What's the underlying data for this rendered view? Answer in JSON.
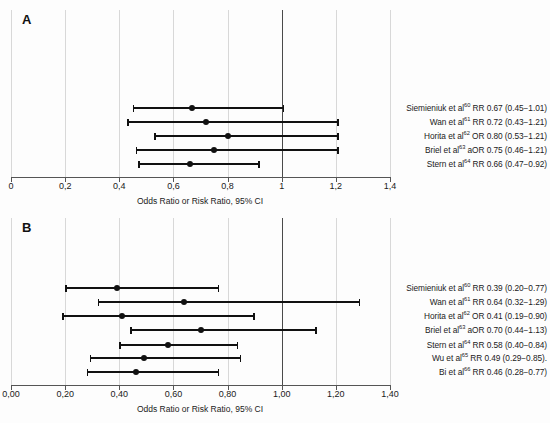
{
  "figure": {
    "background_color": "#fdfdfd",
    "marker_color": "#111111",
    "gridline_color": "#d8d8d8",
    "reference_line_color": "#4a4a4a"
  },
  "panels": [
    {
      "id": "A",
      "letter": "A",
      "axis_title": "Odds Ratio or Risk Ratio, 95% CI",
      "tick_labels": [
        "0",
        "0,2",
        "0,4",
        "0,6",
        "0,8",
        "1",
        "1,2",
        "1,4"
      ],
      "tick_values": [
        0,
        0.2,
        0.4,
        0.6,
        0.8,
        1.0,
        1.2,
        1.4
      ],
      "reference_value": 1.0,
      "rows": [
        {
          "label_text": "Siemieniuk et al",
          "ref": "60",
          "measure": "RR",
          "estimate_text": "0.67",
          "ci_text": "(0.45−1.01)",
          "full_label": "Siemieniuk et al60 RR 0.67 (0.45−1.01)",
          "estimate": 0.67,
          "ci_low": 0.45,
          "ci_high": 1.01,
          "trailing": ""
        },
        {
          "label_text": "Wan et al",
          "ref": "61",
          "measure": "RR",
          "estimate_text": "0.72",
          "ci_text": "(0.43−1.21)",
          "full_label": "Wan et al 61 RR 0.72 (0.43−1.21)",
          "estimate": 0.72,
          "ci_low": 0.43,
          "ci_high": 1.21,
          "trailing": ""
        },
        {
          "label_text": "Horita et al",
          "ref": "62",
          "measure": "OR",
          "estimate_text": "0.80",
          "ci_text": "(0.53−1.21)",
          "full_label": "Horita et al 62 OR 0.80 (0.53−1.21)",
          "estimate": 0.8,
          "ci_low": 0.53,
          "ci_high": 1.21,
          "trailing": ""
        },
        {
          "label_text": "Briel et al",
          "ref": "63",
          "measure": "aOR",
          "estimate_text": "0.75",
          "ci_text": "(0.46−1.21)",
          "full_label": "Briel et al 63 aOR 0.75 (0.46−1.21)",
          "estimate": 0.75,
          "ci_low": 0.46,
          "ci_high": 1.21,
          "trailing": ""
        },
        {
          "label_text": "Stern et al",
          "ref": "64",
          "measure": "RR",
          "estimate_text": "0.66",
          "ci_text": "(0.47−0.92)",
          "full_label": "Stern et al 64 RR 0.66 (0.47−0.92)",
          "estimate": 0.66,
          "ci_low": 0.47,
          "ci_high": 0.92,
          "trailing": ""
        }
      ]
    },
    {
      "id": "B",
      "letter": "B",
      "axis_title": "Odds Ratio or Risk Ratio, 95% CI",
      "tick_labels": [
        "0,00",
        "0,20",
        "0,40",
        "0,60",
        "0,80",
        "1,00",
        "1,20",
        "1,40"
      ],
      "tick_values": [
        0,
        0.2,
        0.4,
        0.6,
        0.8,
        1.0,
        1.2,
        1.4
      ],
      "reference_value": 1.0,
      "rows": [
        {
          "label_text": "Siemieniuk et al",
          "ref": "60",
          "measure": "RR",
          "estimate_text": "0.39",
          "ci_text": "(0.20−0.77)",
          "full_label": "Siemieniuk et al 60 RR 0.39 (0.20−0.77)",
          "estimate": 0.39,
          "ci_low": 0.2,
          "ci_high": 0.77,
          "trailing": ""
        },
        {
          "label_text": "Wan et al",
          "ref": "61",
          "measure": "RR",
          "estimate_text": "0.64",
          "ci_text": "(0.32−1.29)",
          "full_label": "Wan et al 61 RR 0.64 (0.32−1.29)",
          "estimate": 0.64,
          "ci_low": 0.32,
          "ci_high": 1.29,
          "trailing": ""
        },
        {
          "label_text": "Horita et al",
          "ref": "62",
          "measure": "OR",
          "estimate_text": "0.41",
          "ci_text": "(0.19−0.90)",
          "full_label": "Horita et al 62 OR 0.41 (0.19−0.90)",
          "estimate": 0.41,
          "ci_low": 0.19,
          "ci_high": 0.9,
          "trailing": ""
        },
        {
          "label_text": "Briel et al",
          "ref": "63",
          "measure": "aOR",
          "estimate_text": "0.70",
          "ci_text": "(0.44−1.13)",
          "full_label": "Briel et al 63 aOR 0.70 (0.44−1.13)",
          "estimate": 0.7,
          "ci_low": 0.44,
          "ci_high": 1.13,
          "trailing": ""
        },
        {
          "label_text": "Stern et al",
          "ref": "64",
          "measure": "RR",
          "estimate_text": "0.58",
          "ci_text": "(0.40−0.84)",
          "full_label": "Stern et al 64 RR 0.58 (0.40−0.84)",
          "estimate": 0.58,
          "ci_low": 0.4,
          "ci_high": 0.84,
          "trailing": ""
        },
        {
          "label_text": "Wu et al",
          "ref": "65",
          "measure": "RR",
          "estimate_text": "0.49",
          "ci_text": "(0.29−0.85)",
          "full_label": "Wu et al 65 RR 0.49 (0.29−0.85).",
          "estimate": 0.49,
          "ci_low": 0.29,
          "ci_high": 0.85,
          "trailing": "."
        },
        {
          "label_text": "Bi et al",
          "ref": "66",
          "measure": "RR",
          "estimate_text": "0.46",
          "ci_text": "(0.28−0.77)",
          "full_label": "Bi et al 66 RR 0.46 (0.28−0.77)",
          "estimate": 0.46,
          "ci_low": 0.28,
          "ci_high": 0.77,
          "trailing": ""
        }
      ]
    }
  ],
  "chart_data": {
    "type": "scatter",
    "subtype": "forest-plot",
    "title": "",
    "xlabel": "Odds Ratio or Risk Ratio, 95% CI",
    "ylabel": "",
    "xlim": [
      0,
      1.4
    ],
    "grid": true,
    "legend": "none",
    "reference_line": 1.0,
    "decimal_separator": ",",
    "panels": [
      {
        "panel": "A",
        "xticks": [
          0,
          0.2,
          0.4,
          0.6,
          0.8,
          1.0,
          1.2,
          1.4
        ],
        "xticklabels": [
          "0",
          "0,2",
          "0,4",
          "0,6",
          "0,8",
          "1",
          "1,2",
          "1,4"
        ],
        "studies": [
          "Siemieniuk et al 60",
          "Wan et al 61",
          "Horita et al 62",
          "Briel et al 63",
          "Stern et al 64"
        ],
        "measures": [
          "RR",
          "RR",
          "OR",
          "aOR",
          "RR"
        ],
        "estimates": [
          0.67,
          0.72,
          0.8,
          0.75,
          0.66
        ],
        "ci_low": [
          0.45,
          0.43,
          0.53,
          0.46,
          0.47
        ],
        "ci_high": [
          1.01,
          1.21,
          1.21,
          1.21,
          0.92
        ]
      },
      {
        "panel": "B",
        "xticks": [
          0,
          0.2,
          0.4,
          0.6,
          0.8,
          1.0,
          1.2,
          1.4
        ],
        "xticklabels": [
          "0,00",
          "0,20",
          "0,40",
          "0,60",
          "0,80",
          "1,00",
          "1,20",
          "1,40"
        ],
        "studies": [
          "Siemieniuk et al 60",
          "Wan et al 61",
          "Horita et al 62",
          "Briel et al 63",
          "Stern et al 64",
          "Wu et al 65",
          "Bi et al 66"
        ],
        "measures": [
          "RR",
          "RR",
          "OR",
          "aOR",
          "RR",
          "RR",
          "RR"
        ],
        "estimates": [
          0.39,
          0.64,
          0.41,
          0.7,
          0.58,
          0.49,
          0.46
        ],
        "ci_low": [
          0.2,
          0.32,
          0.19,
          0.44,
          0.4,
          0.29,
          0.28
        ],
        "ci_high": [
          0.77,
          1.29,
          0.9,
          1.13,
          0.84,
          0.85,
          0.77
        ]
      }
    ]
  }
}
